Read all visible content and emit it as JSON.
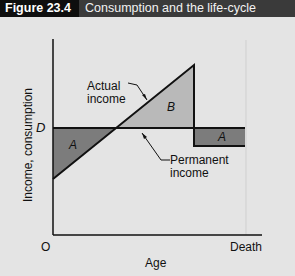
{
  "header": {
    "figure_number": "Figure 23.4",
    "title": "Consumption and the life-cycle"
  },
  "diagram": {
    "y_axis_label": "Income, consumption",
    "x_axis_label": "Age",
    "origin_label": "O",
    "x_end_label": "Death",
    "y_level_label": "D",
    "actual_income_label_line1": "Actual",
    "actual_income_label_line2": "income",
    "permanent_income_label_line1": "Permanent",
    "permanent_income_label_line2": "income",
    "region_a_left": "A",
    "region_b": "B",
    "region_a_right": "A",
    "colors": {
      "region_a": "#7c7c7c",
      "region_b": "#b9b9b9",
      "background": "#e4e4e4",
      "title_bar": "#3a3a3a",
      "figure_tag": "#0e0e0e"
    }
  }
}
